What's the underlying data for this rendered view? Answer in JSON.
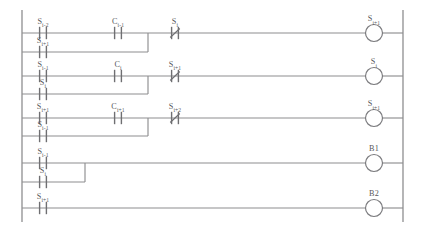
{
  "diagram": {
    "type": "ladder-logic",
    "line_color": "#8e8e90",
    "label_color": "#58585b",
    "background": "#ffffff",
    "rails": {
      "left_x": 22,
      "right_x": 403,
      "top_y": 10,
      "bottom_y": 222
    },
    "rungs": [
      {
        "id": "rung-1",
        "y": 33,
        "output": {
          "name": "coil",
          "base": "S",
          "sub": "i+1",
          "label": "S i+1"
        },
        "elements": [
          {
            "kind": "contact-no",
            "base": "S",
            "sub": "i-2",
            "label": "S i-2",
            "x": 43
          },
          {
            "kind": "contact-no",
            "base": "C",
            "sub": "i-1",
            "label": "C i-1",
            "x": 118
          },
          {
            "kind": "contact-nc",
            "base": "S",
            "sub": "i",
            "label": "S i",
            "x": 175
          }
        ],
        "branch": {
          "y": 52,
          "join_x": 148,
          "elements": [
            {
              "kind": "contact-no",
              "base": "S",
              "sub": "i+1",
              "label": "S i+1",
              "x": 43
            }
          ]
        }
      },
      {
        "id": "rung-2",
        "y": 76,
        "output": {
          "name": "coil",
          "base": "S",
          "sub": "i",
          "label": "S i"
        },
        "elements": [
          {
            "kind": "contact-no",
            "base": "S",
            "sub": "i-1",
            "label": "S i-1",
            "x": 43
          },
          {
            "kind": "contact-no",
            "base": "C",
            "sub": "i",
            "label": "C i",
            "x": 118
          },
          {
            "kind": "contact-nc",
            "base": "S",
            "sub": "i+1",
            "label": "S i+1",
            "x": 175
          }
        ],
        "branch": {
          "y": 94,
          "join_x": 148,
          "elements": [
            {
              "kind": "contact-no",
              "base": "S",
              "sub": "i",
              "label": "S i",
              "x": 43
            }
          ]
        }
      },
      {
        "id": "rung-3",
        "y": 118,
        "output": {
          "name": "coil",
          "base": "S",
          "sub": "i+1",
          "label": "S i+1"
        },
        "elements": [
          {
            "kind": "contact-no",
            "base": "S",
            "sub": "i+1",
            "label": "S i+1",
            "x": 43
          },
          {
            "kind": "contact-no",
            "base": "C",
            "sub": "i+1",
            "label": "C i+1",
            "x": 118
          },
          {
            "kind": "contact-nc",
            "base": "S",
            "sub": "i+2",
            "label": "S i+2",
            "x": 175
          }
        ],
        "branch": {
          "y": 136,
          "join_x": 148,
          "elements": [
            {
              "kind": "contact-no",
              "base": "S",
              "sub": "i-1",
              "label": "S i-1",
              "x": 43
            }
          ]
        }
      },
      {
        "id": "rung-4",
        "y": 163,
        "output": {
          "name": "coil",
          "base": "B1",
          "sub": "",
          "label": "B1"
        },
        "elements": [
          {
            "kind": "contact-no",
            "base": "S",
            "sub": "i-1",
            "label": "S i-1",
            "x": 43
          }
        ],
        "branch": {
          "y": 182,
          "join_x": 85,
          "elements": [
            {
              "kind": "contact-no",
              "base": "S",
              "sub": "i",
              "label": "S i",
              "x": 43
            }
          ]
        }
      },
      {
        "id": "rung-5",
        "y": 208,
        "output": {
          "name": "coil",
          "base": "B2",
          "sub": "",
          "label": "B2"
        },
        "elements": [
          {
            "kind": "contact-no",
            "base": "S",
            "sub": "i+1",
            "label": "S i+1",
            "x": 43
          }
        ],
        "branch": null
      }
    ],
    "coil_x": 374,
    "coil_radius": 8.5
  }
}
